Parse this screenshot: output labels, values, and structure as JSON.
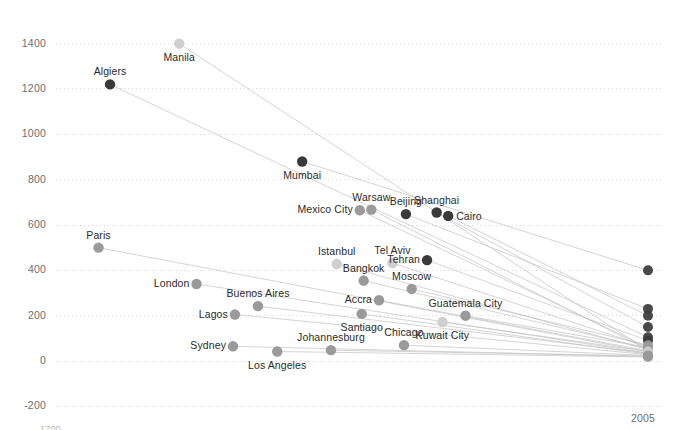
{
  "chart_data": {
    "type": "line",
    "title": "",
    "xlabel": "",
    "ylabel": "",
    "x": [
      1700,
      2005
    ],
    "xlim": [
      1700,
      2005
    ],
    "ylim": [
      -260,
      1460
    ],
    "grid": true,
    "legend": "none",
    "xticklabels": [
      "1700",
      "2005"
    ],
    "yticklabels": [
      "1400",
      "1200",
      "1000",
      "800",
      "600",
      "400",
      "200",
      "0",
      "-200"
    ],
    "yticks": [
      1400,
      1200,
      1000,
      800,
      600,
      400,
      200,
      0,
      -200
    ],
    "series": [
      {
        "name": "Manila",
        "label_pos": "below-center",
        "tone": "light",
        "start_x": 1761,
        "values": [
          1400,
          45
        ]
      },
      {
        "name": "Algiers",
        "label_pos": "above-center",
        "tone": "dark",
        "start_x": 1725,
        "values": [
          1220,
          105
        ]
      },
      {
        "name": "Mumbai",
        "label_pos": "below-center",
        "tone": "dark",
        "start_x": 1825,
        "values": [
          880,
          400
        ]
      },
      {
        "name": "Mexico City",
        "label_pos": "left",
        "tone": "mid",
        "start_x": 1855,
        "values": [
          665,
          60
        ]
      },
      {
        "name": "Warsaw",
        "label_pos": "above-center",
        "tone": "mid",
        "start_x": 1861,
        "values": [
          668,
          50
        ]
      },
      {
        "name": "Beijing",
        "label_pos": "above-center",
        "tone": "dark",
        "start_x": 1879,
        "values": [
          648,
          230
        ]
      },
      {
        "name": "Shanghai",
        "label_pos": "above-center",
        "tone": "dark",
        "start_x": 1895,
        "values": [
          655,
          150
        ]
      },
      {
        "name": "Cairo",
        "label_pos": "right",
        "tone": "dark",
        "start_x": 1901,
        "values": [
          640,
          200
        ]
      },
      {
        "name": "Paris",
        "label_pos": "above-center",
        "tone": "mid",
        "start_x": 1719,
        "values": [
          500,
          40
        ]
      },
      {
        "name": "Istanbul",
        "label_pos": "above-center",
        "tone": "light",
        "start_x": 1843,
        "values": [
          428,
          50
        ]
      },
      {
        "name": "Tel Aviv",
        "label_pos": "above-center",
        "tone": "light",
        "start_x": 1872,
        "values": [
          432,
          62
        ]
      },
      {
        "name": "Tehran",
        "label_pos": "left",
        "tone": "dark",
        "start_x": 1890,
        "values": [
          445,
          90
        ]
      },
      {
        "name": "Bangkok",
        "label_pos": "above-center",
        "tone": "mid",
        "start_x": 1857,
        "values": [
          355,
          55
        ]
      },
      {
        "name": "Moscow",
        "label_pos": "above-center",
        "tone": "mid",
        "start_x": 1882,
        "values": [
          318,
          70
        ]
      },
      {
        "name": "London",
        "label_pos": "left",
        "tone": "mid",
        "start_x": 1770,
        "values": [
          340,
          35
        ]
      },
      {
        "name": "Accra",
        "label_pos": "left",
        "tone": "mid",
        "start_x": 1865,
        "values": [
          268,
          45
        ]
      },
      {
        "name": "Buenos Aires",
        "label_pos": "above-center",
        "tone": "mid",
        "start_x": 1802,
        "values": [
          242,
          35
        ]
      },
      {
        "name": "Guatemala City",
        "label_pos": "above-center",
        "tone": "mid",
        "start_x": 1910,
        "values": [
          200,
          60
        ]
      },
      {
        "name": "Santiago",
        "label_pos": "below-center",
        "tone": "mid",
        "start_x": 1856,
        "values": [
          208,
          30
        ]
      },
      {
        "name": "Lagos",
        "label_pos": "left",
        "tone": "mid",
        "start_x": 1790,
        "values": [
          205,
          28
        ]
      },
      {
        "name": "Kuwait City",
        "label_pos": "below-center",
        "tone": "light",
        "start_x": 1898,
        "values": [
          172,
          42
        ]
      },
      {
        "name": "Chicago",
        "label_pos": "above-center",
        "tone": "mid",
        "start_x": 1878,
        "values": [
          70,
          25
        ]
      },
      {
        "name": "Johannesburg",
        "label_pos": "above-center",
        "tone": "mid",
        "start_x": 1840,
        "values": [
          48,
          22
        ]
      },
      {
        "name": "Sydney",
        "label_pos": "left",
        "tone": "mid",
        "start_x": 1789,
        "values": [
          65,
          20
        ]
      },
      {
        "name": "Los Angeles",
        "label_pos": "below-center",
        "tone": "mid",
        "start_x": 1812,
        "values": [
          42,
          18
        ]
      }
    ]
  },
  "colors": {
    "dark": "#3a3a3a",
    "mid": "#9a9a9a",
    "light": "#cfcfcf",
    "gridline": "#d8d8d8",
    "connector": "#c2c2c2",
    "tick_text": "#6e6e6e",
    "label_text": "#2b2b2b",
    "background": "#ffffff"
  }
}
